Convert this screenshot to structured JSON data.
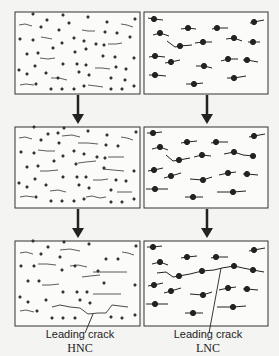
{
  "figure": {
    "type": "crack-evolution-schematic",
    "columns": [
      {
        "id": "hnc",
        "caption_1": "Leading crack",
        "caption_2": "HNC"
      },
      {
        "id": "lnc",
        "caption_1": "Leading crack",
        "caption_2": "LNC"
      }
    ],
    "rows": 3,
    "colors": {
      "ink": "#222222",
      "background": "#f4f4f2",
      "panel_fill": "#fbfbfa"
    }
  }
}
